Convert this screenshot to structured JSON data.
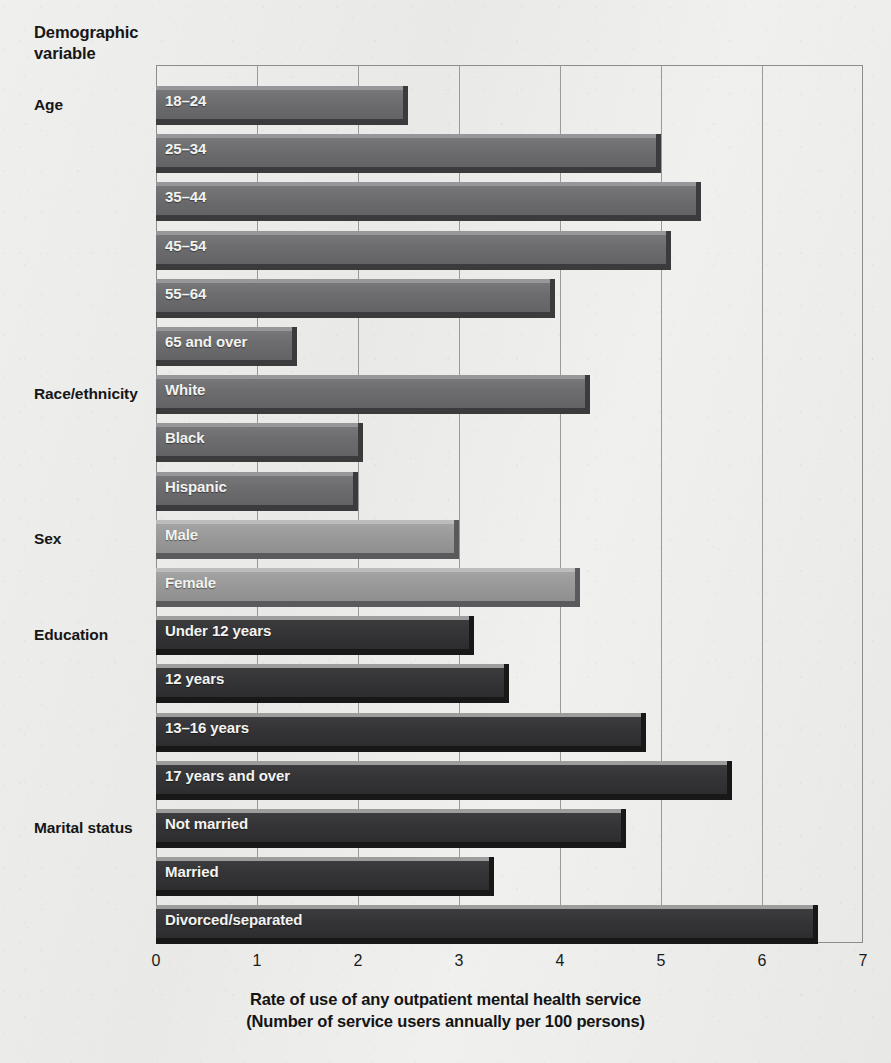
{
  "axis_heading": "Demographic\nvariable",
  "axis_heading_lines": [
    "Demographic",
    "variable"
  ],
  "x_axis": {
    "title_line1": "Rate of use of any outpatient mental health service",
    "title_line2": "(Number of service users annually per 100 persons)",
    "ticks": [
      "0",
      "1",
      "2",
      "3",
      "4",
      "5",
      "6",
      "7"
    ]
  },
  "colors": {
    "background": "#eeeeec",
    "frame": "#8d8d8d",
    "gridline": "#9a9a9a",
    "bar_mid": "#6c6c6f",
    "bar_light": "#999999",
    "bar_dark": "#343436",
    "bar_label_text": "#f3f3f1",
    "text": "#161616"
  },
  "groups": [
    {
      "label": "Age",
      "shade": "mid"
    },
    {
      "label": "Race/ethnicity",
      "shade": "mid"
    },
    {
      "label": "Sex",
      "shade": "light"
    },
    {
      "label": "Education",
      "shade": "dark"
    },
    {
      "label": "Marital status",
      "shade": "dark"
    }
  ],
  "chart_data": {
    "type": "bar",
    "orientation": "horizontal",
    "title": "",
    "xlabel": "Rate of use of any outpatient mental health service (Number of service users annually per 100 persons)",
    "ylabel": "Demographic variable",
    "xlim": [
      0,
      7
    ],
    "xticks": [
      0,
      1,
      2,
      3,
      4,
      5,
      6,
      7
    ],
    "grid": true,
    "legend": "none",
    "value_unit": "service users annually per 100 persons",
    "groups": [
      {
        "name": "Age",
        "shade": "mid",
        "categories": [
          "18–24",
          "25–34",
          "35–44",
          "45–54",
          "55–64",
          "65 and over"
        ],
        "values": [
          2.45,
          4.95,
          5.35,
          5.05,
          3.9,
          1.35
        ]
      },
      {
        "name": "Race/ethnicity",
        "shade": "mid",
        "categories": [
          "White",
          "Black",
          "Hispanic"
        ],
        "values": [
          4.25,
          2.0,
          1.95
        ]
      },
      {
        "name": "Sex",
        "shade": "light",
        "categories": [
          "Male",
          "Female"
        ],
        "values": [
          2.95,
          4.15
        ]
      },
      {
        "name": "Education",
        "shade": "dark",
        "categories": [
          "Under 12 years",
          "12 years",
          "13–16 years",
          "17 years and over"
        ],
        "values": [
          3.1,
          3.45,
          4.8,
          5.65
        ]
      },
      {
        "name": "Marital status",
        "shade": "dark",
        "categories": [
          "Not married",
          "Married",
          "Divorced/separated"
        ],
        "values": [
          4.6,
          3.3,
          6.5
        ]
      }
    ],
    "categories": [
      "18–24",
      "25–34",
      "35–44",
      "45–54",
      "55–64",
      "65 and over",
      "White",
      "Black",
      "Hispanic",
      "Male",
      "Female",
      "Under 12 years",
      "12 years",
      "13–16 years",
      "17 years and over",
      "Not married",
      "Married",
      "Divorced/separated"
    ],
    "values": [
      2.45,
      4.95,
      5.35,
      5.05,
      3.9,
      1.35,
      4.25,
      2.0,
      1.95,
      2.95,
      4.15,
      3.1,
      3.45,
      4.8,
      5.65,
      4.6,
      3.3,
      6.5
    ]
  },
  "layout": {
    "plot_left": 156,
    "plot_top": 65,
    "plot_width": 707,
    "plot_height": 878,
    "bar_pitch": 48.2,
    "first_bar_top": 86,
    "px_per_unit": 101
  }
}
